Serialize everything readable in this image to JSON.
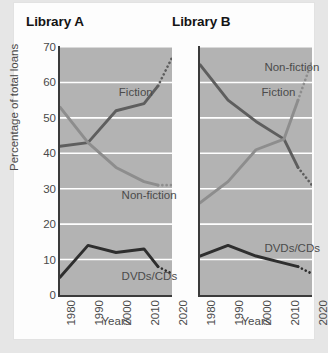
{
  "page": {
    "background_color": "#e6e6e6",
    "card_color": "#fdfdfd"
  },
  "style": {
    "plot_background": "#b3b3b3",
    "gridline_color": "#ffffff",
    "axis_color": "#3b3b3b",
    "fiction_color": "#5e5e5e",
    "nonfiction_color": "#8d8d8d",
    "dvds_color": "#2e2e2e",
    "label_color": "#4a4a4a"
  },
  "charts": [
    {
      "id": "library-a",
      "title": "Library A",
      "xlabel": "Years",
      "ylabel": "Percentage of total loans",
      "ylim": [
        0,
        70
      ],
      "yticks": [
        0,
        10,
        20,
        30,
        40,
        50,
        60,
        70
      ],
      "xticks": [
        "1980",
        "1990",
        "2000",
        "2010",
        "2020"
      ],
      "series_labels": {
        "fiction": "Fiction",
        "nonfiction": "Non-fiction",
        "dvds": "DVDs/CDs"
      }
    },
    {
      "id": "library-b",
      "title": "Library B",
      "xlabel": "Years",
      "ylabel": "",
      "ylim": [
        0,
        70
      ],
      "yticks": [
        0,
        10,
        20,
        30,
        40,
        50,
        60,
        70
      ],
      "xticks": [
        "1980",
        "1990",
        "2000",
        "2010",
        "2020"
      ],
      "series_labels": {
        "fiction": "Fiction",
        "nonfiction": "Non-fiction",
        "dvds": "DVDs/CDs"
      }
    }
  ],
  "chart_data": [
    {
      "type": "line",
      "title": "Library A",
      "xlabel": "Years",
      "ylabel": "Percentage of total loans",
      "ylim": [
        0,
        70
      ],
      "xlim": [
        1980,
        2020
      ],
      "yticks": [
        0,
        10,
        20,
        30,
        40,
        50,
        60,
        70
      ],
      "xticks": [
        1980,
        1990,
        2000,
        2010,
        2020
      ],
      "grid": "horizontal",
      "legend": "inline-labels",
      "x": [
        1980,
        1990,
        2000,
        2010,
        2015,
        2020
      ],
      "series": [
        {
          "name": "Fiction",
          "color": "#5e5e5e",
          "values": [
            42,
            43,
            52,
            54,
            59,
            67
          ],
          "solid_until": 2015,
          "projected_from": 2015,
          "label_x": 2001,
          "label_y": 57
        },
        {
          "name": "Non-fiction",
          "color": "#8d8d8d",
          "values": [
            53,
            43,
            36,
            32,
            31,
            31
          ],
          "solid_until": 2015,
          "projected_from": 2015,
          "label_x": 2002,
          "label_y": 28
        },
        {
          "name": "DVDs/CDs",
          "color": "#2e2e2e",
          "values": [
            5,
            14,
            12,
            13,
            8,
            6
          ],
          "solid_until": 2015,
          "projected_from": 2015,
          "label_x": 2002,
          "label_y": 5
        }
      ]
    },
    {
      "type": "line",
      "title": "Library B",
      "xlabel": "Years",
      "ylabel": "",
      "ylim": [
        0,
        70
      ],
      "xlim": [
        1980,
        2020
      ],
      "yticks": [
        0,
        10,
        20,
        30,
        40,
        50,
        60,
        70
      ],
      "xticks": [
        1980,
        1990,
        2000,
        2010,
        2020
      ],
      "grid": "horizontal",
      "legend": "inline-labels",
      "x": [
        1980,
        1990,
        2000,
        2010,
        2015,
        2020
      ],
      "series": [
        {
          "name": "Non-fiction",
          "color": "#5e5e5e",
          "values": [
            65,
            55,
            49,
            44,
            36,
            31
          ],
          "solid_until": 2015,
          "projected_from": 2015,
          "label_x": 2003,
          "label_y": 64
        },
        {
          "name": "Fiction",
          "color": "#8d8d8d",
          "values": [
            26,
            32,
            41,
            44,
            55,
            66
          ],
          "solid_until": 2015,
          "projected_from": 2015,
          "label_x": 2002,
          "label_y": 57
        },
        {
          "name": "DVDs/CDs",
          "color": "#2e2e2e",
          "values": [
            11,
            14,
            11,
            9,
            8,
            6
          ],
          "solid_until": 2015,
          "projected_from": 2015,
          "label_x": 2003,
          "label_y": 13
        }
      ]
    }
  ]
}
